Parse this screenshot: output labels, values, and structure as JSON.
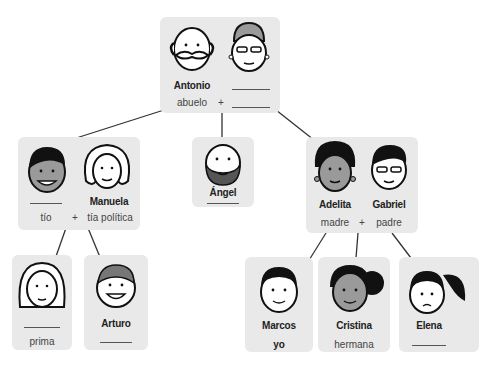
{
  "colors": {
    "card": "#e9e9e9",
    "line": "#333333",
    "skin_light": "#ffffff",
    "skin_dark": "#9a9a9a",
    "hair": "#111111"
  },
  "grandparents": {
    "left": {
      "name": "Antonio",
      "relation": "abuelo",
      "face": "grandfather-mustache"
    },
    "right": {
      "name": "",
      "relation": "",
      "face": "grandmother-glasses"
    },
    "plus": "+"
  },
  "uncle_aunt": {
    "left": {
      "name": "",
      "relation": "tío",
      "face": "uncle-dark"
    },
    "right": {
      "name": "Manuela",
      "relation": "tía política",
      "face": "aunt-curly"
    },
    "plus": "+"
  },
  "angel": {
    "name": "Ángel",
    "relation": "",
    "face": "bearded-man"
  },
  "parents": {
    "left": {
      "name": "Adelita",
      "relation": "madre",
      "face": "mother-curly-dark"
    },
    "right": {
      "name": "Gabriel",
      "relation": "padre",
      "face": "father-glasses"
    },
    "plus": "+"
  },
  "cousins": [
    {
      "name": "",
      "relation": "prima",
      "face": "girl-long-hair"
    },
    {
      "name": "Arturo",
      "relation": "",
      "face": "boy-freckles"
    }
  ],
  "children": [
    {
      "name": "Marcos",
      "relation": "yo",
      "face": "boy"
    },
    {
      "name": "Cristina",
      "relation": "hermana",
      "face": "girl-dark"
    },
    {
      "name": "Elena",
      "relation": "",
      "face": "girl-ponytail"
    }
  ]
}
